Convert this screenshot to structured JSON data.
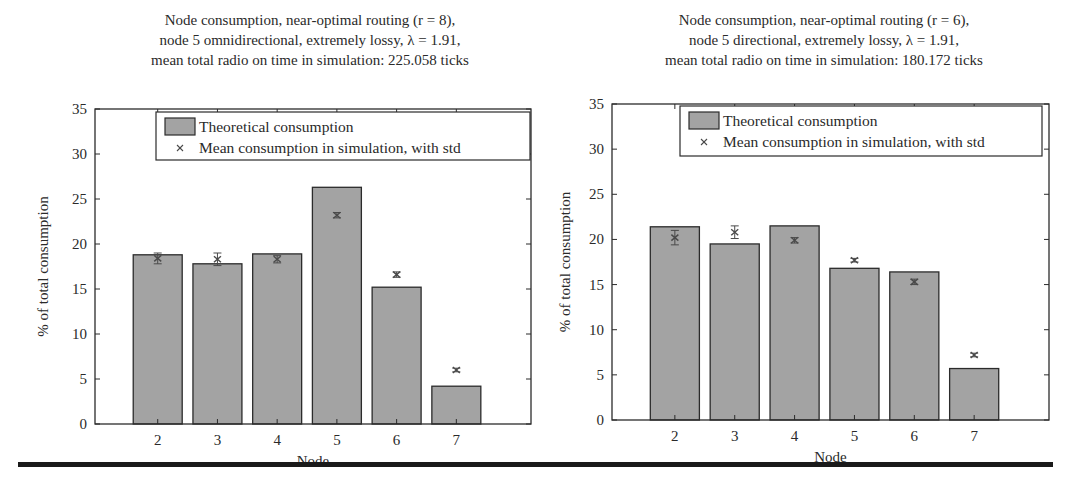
{
  "chart_data": [
    {
      "type": "bar",
      "title": "Node consumption, near-optimal routing (r = 8), node 5 omnidirectional, extremely lossy, λ = 1.91, mean total radio on time in simulation: 225.058 ticks",
      "title_lines": [
        "Node consumption, near-optimal routing (r = 8),",
        "node 5 omnidirectional,  extremely lossy, λ = 1.91,",
        "mean total radio on time in simulation: 225.058 ticks"
      ],
      "xlabel": "Node",
      "ylabel": "% of total consumption",
      "categories": [
        "2",
        "3",
        "4",
        "5",
        "6",
        "7"
      ],
      "ylim": [
        0,
        35
      ],
      "yticks": [
        0,
        5,
        10,
        15,
        20,
        25,
        30,
        35
      ],
      "grid": false,
      "legend_position": "upper right",
      "legend": [
        "Theoretical consumption",
        "Mean consumption in simulation, with std"
      ],
      "series": [
        {
          "name": "Theoretical consumption",
          "kind": "bar",
          "values": [
            18.8,
            17.8,
            18.9,
            26.3,
            15.2,
            4.2
          ]
        },
        {
          "name": "Mean consumption in simulation, with std",
          "kind": "errorbar",
          "values": [
            18.4,
            18.3,
            18.3,
            23.2,
            16.6,
            6.0
          ],
          "std": [
            0.6,
            0.7,
            0.4,
            0.3,
            0.3,
            0.2
          ]
        }
      ]
    },
    {
      "type": "bar",
      "title": "Node consumption, near-optimal routing (r = 6), node 5 directional, extremely lossy, λ = 1.91, mean total radio on time in simulation: 180.172 ticks",
      "title_lines": [
        "Node consumption, near-optimal routing (r = 6),",
        "node 5 directional,  extremely lossy, λ = 1.91,",
        "mean total radio on time in simulation: 180.172 ticks"
      ],
      "xlabel": "Node",
      "ylabel": "% of total consumption",
      "categories": [
        "2",
        "3",
        "4",
        "5",
        "6",
        "7"
      ],
      "ylim": [
        0,
        35
      ],
      "yticks": [
        0,
        5,
        10,
        15,
        20,
        25,
        30,
        35
      ],
      "grid": false,
      "legend_position": "upper right",
      "legend": [
        "Theoretical consumption",
        "Mean consumption in simulation, with std"
      ],
      "series": [
        {
          "name": "Theoretical consumption",
          "kind": "bar",
          "values": [
            21.4,
            19.5,
            21.5,
            16.8,
            16.4,
            5.7
          ]
        },
        {
          "name": "Mean consumption in simulation, with std",
          "kind": "errorbar",
          "values": [
            20.2,
            20.8,
            19.9,
            17.7,
            15.3,
            7.2
          ],
          "std": [
            0.8,
            0.7,
            0.3,
            0.2,
            0.3,
            0.2
          ]
        }
      ]
    }
  ],
  "colors": {
    "bar_fill": "#a3a3a3",
    "bar_edge": "#2b2b2b",
    "axis": "#2b2b2b",
    "marker": "#4a4a4a"
  }
}
